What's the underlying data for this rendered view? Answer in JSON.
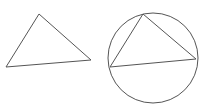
{
  "figure": {
    "stroke_color": "#555555",
    "background_color": "#ffffff",
    "shapes": [
      {
        "name": "standalone-triangle",
        "type": "triangle"
      },
      {
        "name": "inscribed-triangle",
        "type": "triangle",
        "inscribed_in": "circumcircle"
      },
      {
        "name": "circumcircle",
        "type": "circle"
      }
    ]
  }
}
